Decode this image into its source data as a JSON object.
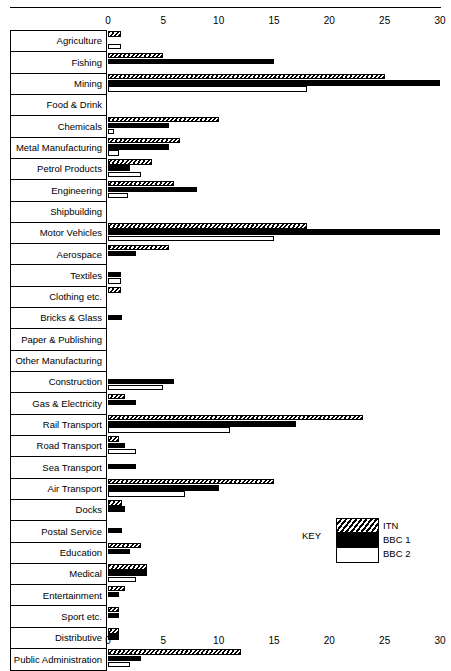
{
  "axis": {
    "ticks": [
      0,
      5,
      10,
      15,
      20,
      25,
      30
    ],
    "min": 0,
    "max": 30
  },
  "legend": {
    "title": "KEY",
    "entries": [
      {
        "label": "ITN",
        "pattern": "diagonal-hatch"
      },
      {
        "label": "BBC 1",
        "pattern": "solid-black"
      },
      {
        "label": "BBC 2",
        "pattern": "white-outline"
      }
    ]
  },
  "chart_data": {
    "type": "bar",
    "orientation": "horizontal",
    "title": "",
    "xlabel": "",
    "ylabel": "",
    "xlim": [
      0,
      30
    ],
    "grid": false,
    "legend_position": "bottom-right",
    "axis_top": true,
    "axis_bottom": true,
    "categories": [
      "Agriculture",
      "Fishing",
      "Mining",
      "Food & Drink",
      "Chemicals",
      "Metal Manufacturing",
      "Petrol Products",
      "Engineering",
      "Shipbuilding",
      "Motor Vehicles",
      "Aerospace",
      "Textiles",
      "Clothing etc.",
      "Bricks & Glass",
      "Paper & Publishing",
      "Other Manufacturing",
      "Construction",
      "Gas & Electricity",
      "Rail Transport",
      "Road Transport",
      "Sea Transport",
      "Air Transport",
      "Docks",
      "Postal Service",
      "Education",
      "Medical",
      "Entertainment",
      "Sport etc.",
      "Distributive",
      "Public Administration"
    ],
    "series": [
      {
        "name": "ITN",
        "values": [
          1.2,
          5.0,
          25.0,
          0,
          10.0,
          6.5,
          4.0,
          6.0,
          0,
          18.0,
          5.5,
          0,
          1.2,
          0,
          0,
          0,
          0,
          1.5,
          23.0,
          1.0,
          0,
          15.0,
          1.3,
          0,
          3.0,
          3.5,
          1.5,
          1.0,
          1.0,
          12.0
        ]
      },
      {
        "name": "BBC 1",
        "values": [
          0,
          15.0,
          30.0,
          0,
          5.5,
          5.5,
          2.0,
          8.0,
          0,
          30.0,
          2.5,
          1.2,
          0,
          1.3,
          0,
          0,
          6.0,
          2.5,
          17.0,
          1.5,
          2.5,
          10.0,
          1.5,
          1.3,
          2.0,
          3.5,
          1.0,
          1.0,
          1.0,
          3.0
        ]
      },
      {
        "name": "BBC 2",
        "values": [
          1.2,
          0,
          18.0,
          0,
          0.5,
          1.0,
          3.0,
          1.8,
          0,
          15.0,
          0,
          1.2,
          0,
          0,
          0,
          0,
          5.0,
          0,
          11.0,
          2.5,
          0,
          7.0,
          0,
          0,
          0,
          2.5,
          0,
          0,
          0,
          2.0
        ]
      }
    ]
  }
}
